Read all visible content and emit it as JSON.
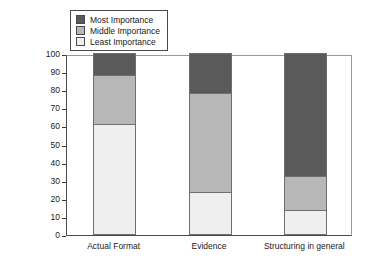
{
  "chart_data": {
    "type": "bar",
    "subtype": "stacked-percentage",
    "title": "",
    "xlabel": "",
    "ylabel": "Percentage of Respondents",
    "ylim": [
      0,
      100
    ],
    "ytick_step": 10,
    "yticks": [
      0,
      10,
      20,
      30,
      40,
      50,
      60,
      70,
      80,
      90,
      100
    ],
    "ytick_labels": [
      "0",
      "10",
      "20",
      "30",
      "40",
      "50",
      "60",
      "70",
      "80",
      "90",
      "100"
    ],
    "grid": false,
    "legend_position": "top-left-inside",
    "categories": [
      "Actual Format",
      "Evidence",
      "Structuring in general"
    ],
    "series": [
      {
        "name": "Most Importance",
        "color": "#5a5a5a",
        "values": [
          12,
          22,
          68
        ]
      },
      {
        "name": "Middle Importance",
        "color": "#b7b7b7",
        "values": [
          27,
          55,
          18.5
        ]
      },
      {
        "name": "Least Importance",
        "color": "#efefef",
        "values": [
          61,
          23,
          13.5
        ]
      }
    ],
    "stack_boundaries": {
      "Actual Format": [
        0,
        61,
        88,
        100
      ],
      "Evidence": [
        0,
        23,
        78,
        100
      ],
      "Structuring in general": [
        0,
        13.5,
        32,
        100
      ]
    }
  },
  "legend": {
    "items": [
      {
        "label": "Most Importance"
      },
      {
        "label": "Middle Importance"
      },
      {
        "label": "Least Importance"
      }
    ]
  },
  "axis": {
    "y_title": "Percentage of Respondents"
  },
  "artifact": {
    "mark": ""
  }
}
